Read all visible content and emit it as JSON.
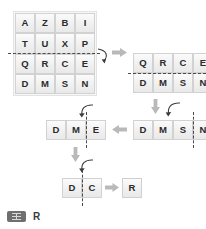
{
  "page": {
    "background_color": "#ffffff",
    "cell_text_color": "#2b2b2b",
    "arrow_color": "#b5b5b5",
    "curve_color": "#3c3c3c",
    "dash_color": "#4a4a4a"
  },
  "puzzle": {
    "type": "paper-folding / punch-hole sequence",
    "answer_label": "R",
    "steps": [
      {
        "id": "step1",
        "name": "initial-grid",
        "rows": 4,
        "cols": 4,
        "fold": {
          "orientation": "horizontal",
          "after_row": 2
        },
        "cells": [
          [
            "A",
            "Z",
            "B",
            "I"
          ],
          [
            "T",
            "U",
            "X",
            "P"
          ],
          [
            "Q",
            "R",
            "C",
            "E"
          ],
          [
            "D",
            "M",
            "S",
            "N"
          ]
        ]
      },
      {
        "id": "step2",
        "name": "grid-after-first-fold",
        "rows": 2,
        "cols": 4,
        "fold": {
          "orientation": "horizontal",
          "after_row": 1
        },
        "cells": [
          [
            "Q",
            "R",
            "C",
            "E"
          ],
          [
            "D",
            "M",
            "S",
            "N"
          ]
        ]
      },
      {
        "id": "step3",
        "name": "row-after-second-fold",
        "rows": 1,
        "cols": 4,
        "fold": {
          "orientation": "vertical",
          "after_col": 3
        },
        "cells": [
          [
            "D",
            "M",
            "S",
            "N"
          ]
        ]
      },
      {
        "id": "step4",
        "name": "row-after-third-fold",
        "rows": 1,
        "cols": 3,
        "fold": {
          "orientation": "vertical",
          "after_col": 2
        },
        "cells": [
          [
            "D",
            "M",
            "E"
          ]
        ]
      },
      {
        "id": "step5",
        "name": "row-after-fourth-fold",
        "rows": 1,
        "cols": 2,
        "fold": {
          "orientation": "vertical",
          "after_col": 1
        },
        "cells": [
          [
            "D",
            "C"
          ]
        ]
      },
      {
        "id": "step6",
        "name": "final-result",
        "rows": 1,
        "cols": 1,
        "cells": [
          [
            "R"
          ]
        ]
      }
    ]
  },
  "icons": {
    "answer_badge": "grid-badge-icon",
    "straight_arrow": "arrow-icon",
    "curved_arrow": "fold-curve-arrow-icon"
  }
}
